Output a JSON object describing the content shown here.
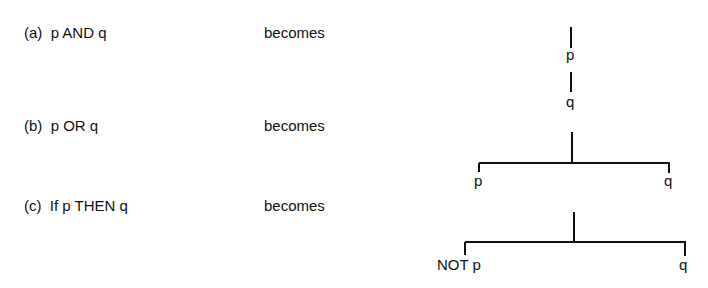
{
  "rules": [
    {
      "id": "a",
      "label": "(a)  p AND q",
      "verb": "becomes"
    },
    {
      "id": "b",
      "label": "(b)  p OR q",
      "verb": "becomes"
    },
    {
      "id": "c",
      "label": "(c)  If p THEN q",
      "verb": "becomes"
    }
  ],
  "trees": {
    "a": {
      "type": "linear",
      "nodes": [
        "p",
        "q"
      ]
    },
    "b": {
      "type": "branch",
      "left": "p",
      "right": "q"
    },
    "c": {
      "type": "branch",
      "left": "NOT p",
      "right": "q"
    }
  },
  "colors": {
    "ink": "#111111",
    "background": "#ffffff"
  }
}
